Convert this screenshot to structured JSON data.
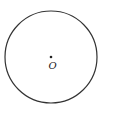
{
  "diagram": {
    "type": "geometry",
    "circle": {
      "center": {
        "x": 51,
        "y": 57
      },
      "radius": 46,
      "stroke": "#333333"
    },
    "center_point": {
      "label": "O",
      "x": 51,
      "y": 57
    }
  }
}
